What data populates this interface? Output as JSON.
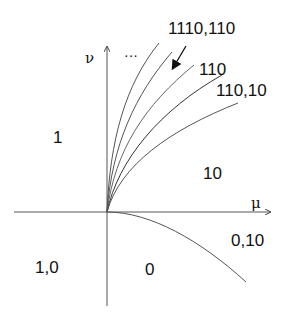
{
  "axes": {
    "x_label": "μ",
    "y_label": "ν"
  },
  "ellipsis": "···",
  "regions": {
    "r1110_110": "1110,110",
    "r110": "110",
    "r110_10": "110,10",
    "r1": "1",
    "r10": "10",
    "r0_10": "0,10",
    "r1_0": "1,0",
    "r0": "0"
  },
  "colors": {
    "line": "#444444",
    "text": "#111111"
  }
}
